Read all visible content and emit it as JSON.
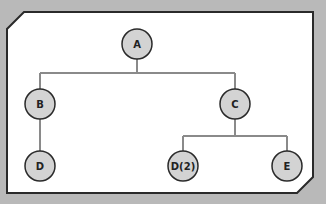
{
  "colors": {
    "background": "#b9b9b9",
    "panel_fill": "#ffffff",
    "panel_border": "#2a2a2a",
    "edge": "#8a8a8a",
    "node_fill": "#d3d3d3",
    "node_stroke": "#2a2a2a",
    "label": "#222222"
  },
  "tree": {
    "nodes": [
      {
        "id": "A",
        "label": "A",
        "x": 137,
        "y": 44
      },
      {
        "id": "B",
        "label": "B",
        "x": 40,
        "y": 104
      },
      {
        "id": "C",
        "label": "C",
        "x": 235,
        "y": 104
      },
      {
        "id": "D",
        "label": "D",
        "x": 40,
        "y": 166
      },
      {
        "id": "D2",
        "label": "D(2)",
        "x": 183,
        "y": 166
      },
      {
        "id": "E",
        "label": "E",
        "x": 287,
        "y": 166
      }
    ],
    "edges": [
      {
        "from": "A",
        "to": "B"
      },
      {
        "from": "A",
        "to": "C"
      },
      {
        "from": "B",
        "to": "D"
      },
      {
        "from": "C",
        "to": "D2"
      },
      {
        "from": "C",
        "to": "E"
      }
    ]
  }
}
